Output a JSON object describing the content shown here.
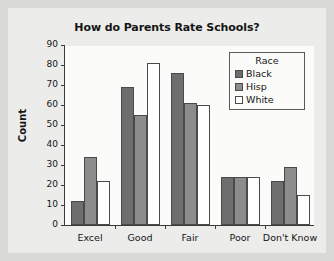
{
  "chart_data": {
    "type": "bar",
    "title": "How do Parents Rate Schools?",
    "xlabel": "",
    "ylabel": "Count",
    "categories": [
      "Excel",
      "Good",
      "Fair",
      "Poor",
      "Don't Know"
    ],
    "series": [
      {
        "name": "Black",
        "color": "#6e6e6e",
        "values": [
          12,
          69,
          76,
          24,
          22
        ]
      },
      {
        "name": "Hisp",
        "color": "#8c8c8c",
        "values": [
          34,
          55,
          61,
          24,
          29
        ]
      },
      {
        "name": "White",
        "color": "#ffffff",
        "values": [
          22,
          81,
          60,
          24,
          15
        ]
      }
    ],
    "ylim": [
      0,
      90
    ],
    "yticks": [
      0,
      10,
      20,
      30,
      40,
      50,
      60,
      70,
      80,
      90
    ],
    "ytick_labels": [
      "0",
      "10",
      "20",
      "30",
      "40",
      "50",
      "60",
      "70",
      "80",
      "90"
    ],
    "grid": false,
    "legend": {
      "title": "Race",
      "position": "top-right",
      "entries": [
        "Black",
        "Hisp",
        "White"
      ]
    }
  },
  "figure": {
    "background_color": "#d9d9d5",
    "panel_color": "#ececeb",
    "plot_background_color": "#fbfbfa",
    "axis_color": "#3a3a3a"
  }
}
